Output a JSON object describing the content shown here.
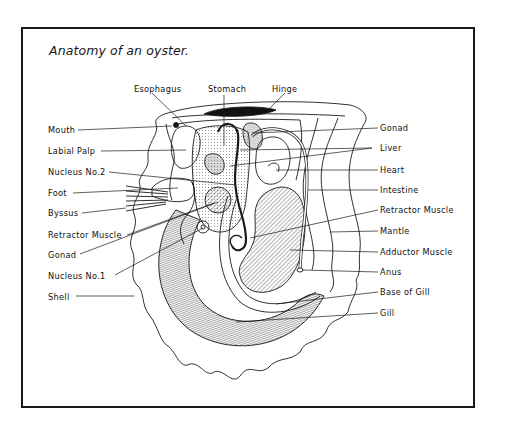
{
  "figure": {
    "title": "Anatomy of an oyster.",
    "colors": {
      "ink": "#1a1a1a",
      "background": "#ffffff"
    }
  },
  "labels": {
    "top": [
      {
        "id": "esophagus",
        "text": "Esophagus"
      },
      {
        "id": "stomach",
        "text": "Stomach"
      },
      {
        "id": "hinge",
        "text": "Hinge"
      }
    ],
    "left": [
      {
        "id": "mouth",
        "text": "Mouth"
      },
      {
        "id": "labial_palp",
        "text": "Labial Palp"
      },
      {
        "id": "nucleus_2",
        "text": "Nucleus No.2"
      },
      {
        "id": "foot",
        "text": "Foot"
      },
      {
        "id": "byssus",
        "text": "Byssus"
      },
      {
        "id": "retractor_muscle_left",
        "text": "Retractor Muscle"
      },
      {
        "id": "gonad_left",
        "text": "Gonad"
      },
      {
        "id": "nucleus_1",
        "text": "Nucleus No.1"
      },
      {
        "id": "shell",
        "text": "Shell"
      }
    ],
    "right": [
      {
        "id": "gonad_right",
        "text": "Gonad"
      },
      {
        "id": "liver",
        "text": "Liver"
      },
      {
        "id": "heart",
        "text": "Heart"
      },
      {
        "id": "intestine",
        "text": "Intestine"
      },
      {
        "id": "retractor_muscle_right",
        "text": "Retractor Muscle"
      },
      {
        "id": "mantle",
        "text": "Mantle"
      },
      {
        "id": "adductor_muscle",
        "text": "Adductor Muscle"
      },
      {
        "id": "anus",
        "text": "Anus"
      },
      {
        "id": "base_of_gill",
        "text": "Base of Gill"
      },
      {
        "id": "gill",
        "text": "Gill"
      }
    ]
  }
}
